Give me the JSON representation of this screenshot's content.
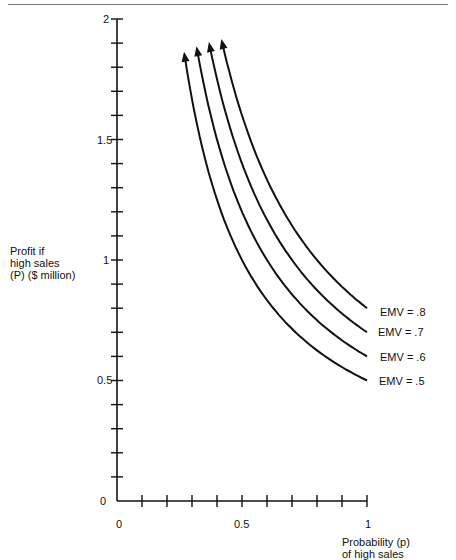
{
  "chart_data": {
    "type": "line",
    "title": "",
    "xlabel": "Probability (p) of high sales",
    "ylabel": "Profit if high sales (P) ($ million)",
    "xlim": [
      0,
      1
    ],
    "ylim": [
      0,
      2
    ],
    "x_ticks": [
      "0",
      "0.5",
      "1"
    ],
    "y_ticks": [
      "0",
      "0.5",
      "1",
      "1.5",
      "2"
    ],
    "x_minor_tick_step": 0.1,
    "y_minor_tick_step": 0.1,
    "grid": false,
    "legend": "inline labels at right end of curves",
    "series": [
      {
        "name": "EMV = .5",
        "emv": 0.5,
        "formula": "P = 0.5 / p",
        "p": [
          0.27,
          0.3,
          0.4,
          0.5,
          0.6,
          0.7,
          0.8,
          0.9,
          1.0
        ],
        "P": [
          1.85,
          1.67,
          1.25,
          1.0,
          0.83,
          0.71,
          0.63,
          0.56,
          0.5
        ]
      },
      {
        "name": "EMV = .6",
        "emv": 0.6,
        "formula": "P = 0.6 / p",
        "p": [
          0.32,
          0.4,
          0.5,
          0.6,
          0.7,
          0.8,
          0.9,
          1.0
        ],
        "P": [
          1.86,
          1.5,
          1.2,
          1.0,
          0.86,
          0.75,
          0.67,
          0.6
        ]
      },
      {
        "name": "EMV = .7",
        "emv": 0.7,
        "formula": "P = 0.7 / p",
        "p": [
          0.37,
          0.4,
          0.5,
          0.6,
          0.7,
          0.8,
          0.9,
          1.0
        ],
        "P": [
          1.88,
          1.75,
          1.4,
          1.17,
          1.0,
          0.88,
          0.78,
          0.7
        ]
      },
      {
        "name": "EMV = .8",
        "emv": 0.8,
        "formula": "P = 0.8 / p",
        "p": [
          0.42,
          0.5,
          0.6,
          0.7,
          0.8,
          0.9,
          1.0
        ],
        "P": [
          1.89,
          1.6,
          1.33,
          1.14,
          1.0,
          0.89,
          0.8
        ]
      }
    ]
  },
  "labels": {
    "y_axis": [
      "Profit if",
      "high sales",
      "(P) ($ million)"
    ],
    "x_axis": [
      "Probability (p)",
      "of high sales"
    ],
    "y_ticks": {
      "t0": "0",
      "t05": "0.5",
      "t1": "1",
      "t15": "1.5",
      "t2": "2"
    },
    "x_ticks": {
      "t0": "0",
      "t05": "0.5",
      "t1": "1"
    },
    "emv": {
      "e8": "EMV = .8",
      "e7": "EMV = .7",
      "e6": "EMV = .6",
      "e5": "EMV = .5"
    }
  }
}
